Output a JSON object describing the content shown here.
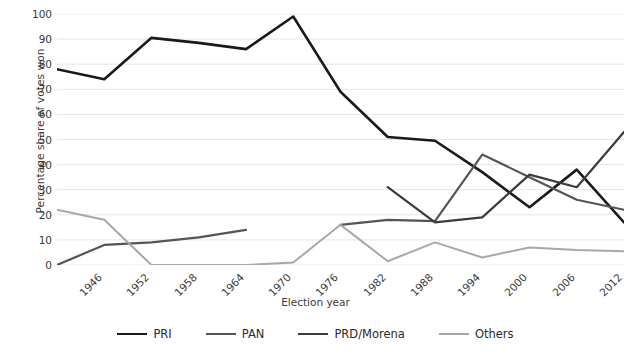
{
  "chart_data": {
    "type": "line",
    "title": "",
    "xlabel": "Election year",
    "ylabel": "Percentage share of votes won",
    "x": [
      1946,
      1952,
      1958,
      1964,
      1970,
      1976,
      1982,
      1988,
      1994,
      2000,
      2006,
      2012,
      2018
    ],
    "categories": [
      "1946",
      "1952",
      "1958",
      "1964",
      "1970",
      "1976",
      "1982",
      "1988",
      "1994",
      "2000",
      "2006",
      "2012",
      "2018"
    ],
    "xlim": [
      1946,
      2018
    ],
    "ylim": [
      0,
      100
    ],
    "yticks": [
      0,
      10,
      20,
      30,
      40,
      50,
      60,
      70,
      80,
      90,
      100
    ],
    "ytick_labels": [
      "0",
      "10",
      "20",
      "30",
      "40",
      "50",
      "60",
      "70",
      "80",
      "90",
      "100"
    ],
    "grid": "horizontal",
    "legend_position": "bottom",
    "series": [
      {
        "name": "PRI",
        "color": "#1a1a1a",
        "values": [
          78,
          74,
          90.5,
          88.5,
          86,
          99,
          69,
          51,
          49.5,
          37,
          23,
          38,
          17
        ]
      },
      {
        "name": "PAN",
        "color": "#555555",
        "values": [
          0,
          8,
          9,
          11,
          14,
          null,
          16,
          18,
          17.5,
          44,
          35,
          26,
          22
        ]
      },
      {
        "name": "PRD/Morena",
        "color": "#3b3b3b",
        "values": [
          null,
          null,
          null,
          null,
          null,
          null,
          null,
          31,
          17,
          19,
          36,
          31,
          53
        ]
      },
      {
        "name": "Others",
        "color": "#a8a8a8",
        "values": [
          22,
          18,
          0,
          0,
          0,
          1,
          16,
          1.5,
          9,
          3,
          7,
          6,
          5.5
        ]
      }
    ]
  },
  "legend": {
    "items": [
      {
        "label": "PRI",
        "color": "#1a1a1a",
        "width": 2.6
      },
      {
        "label": "PAN",
        "color": "#555555",
        "width": 2.2
      },
      {
        "label": "PRD/Morena",
        "color": "#3b3b3b",
        "width": 2.2
      },
      {
        "label": "Others",
        "color": "#a8a8a8",
        "width": 2.0
      }
    ]
  }
}
